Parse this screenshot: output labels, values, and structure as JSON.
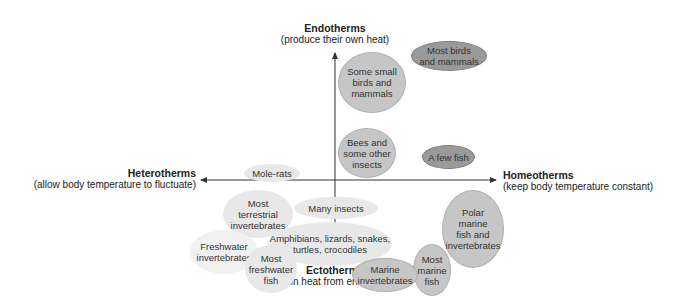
{
  "axes": {
    "top": {
      "title": "Endotherms",
      "subtitle": "(produce their own heat)"
    },
    "bottom": {
      "title": "Ectotherms",
      "subtitle": "(rely on heat from environment)"
    },
    "left": {
      "title": "Heterotherms",
      "subtitle": "(allow body temperature to fluctuate)"
    },
    "right": {
      "title": "Homeotherms",
      "subtitle": "(keep body temperature constant)"
    }
  },
  "groups": [
    {
      "id": "most-birds-mammals",
      "label": "Most birds\nand mammals",
      "shade": "dark"
    },
    {
      "id": "some-small-birds",
      "label": "Some small\nbirds and\nmammals",
      "shade": "mid"
    },
    {
      "id": "bees",
      "label": "Bees and\nsome other\ninsects",
      "shade": "mid"
    },
    {
      "id": "few-fish",
      "label": "A few fish",
      "shade": "dark"
    },
    {
      "id": "mole-rats",
      "label": "Mole-rats",
      "shade": "light"
    },
    {
      "id": "terrestrial-inverts",
      "label": "Most\nterrestrial\ninvertebrates",
      "shade": "light"
    },
    {
      "id": "many-insects",
      "label": "Many insects",
      "shade": "light"
    },
    {
      "id": "amphibians",
      "label": "Amphibians, lizards, snakes,\nturtles, crocodiles",
      "shade": "light"
    },
    {
      "id": "freshwater-inverts",
      "label": "Freshwater\ninvertebrates",
      "shade": "faint"
    },
    {
      "id": "freshwater-fish",
      "label": "Most\nfreshwater\nfish",
      "shade": "light"
    },
    {
      "id": "polar-marine",
      "label": "Polar\nmarine\nfish and\ninvertebrates",
      "shade": "mid"
    },
    {
      "id": "most-marine-fish",
      "label": "Most\nmarine\nfish",
      "shade": "mid"
    },
    {
      "id": "marine-inverts",
      "label": "Marine\ninvertebrates",
      "shade": "mid"
    }
  ],
  "colors": {
    "light": "#e8e8e8",
    "mid": "#c6c6c6",
    "dark": "#9a9a9a",
    "axis": "#333333"
  }
}
